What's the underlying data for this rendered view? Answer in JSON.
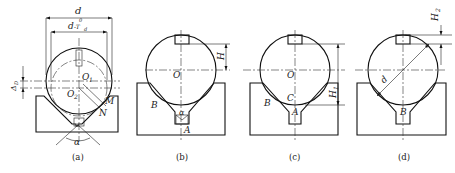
{
  "figure": {
    "panels": [
      {
        "id": "a",
        "caption": "(a)",
        "labels": {
          "d": "d",
          "d_tol": "d",
          "d_tol_sub": "-T",
          "d_tol_subsub": "d",
          "d_tol_sup": "0",
          "delta": "Δ",
          "delta_sub": "D",
          "o1": "O",
          "o1_sub": "1",
          "o2": "O",
          "o2_sub": "2",
          "m": "M",
          "n": "N",
          "alpha": "α"
        }
      },
      {
        "id": "b",
        "caption": "(b)",
        "labels": {
          "h": "H",
          "o": "O",
          "b": "B",
          "alpha": "α",
          "a": "A"
        }
      },
      {
        "id": "c",
        "caption": "(c)",
        "labels": {
          "h1": "H",
          "h1_sub": "1",
          "o": "O",
          "b": "B",
          "c": "C",
          "a": "A"
        }
      },
      {
        "id": "d",
        "caption": "(d)",
        "labels": {
          "h2": "H",
          "h2_sub": "2",
          "d": "d",
          "b": "B"
        }
      }
    ]
  }
}
